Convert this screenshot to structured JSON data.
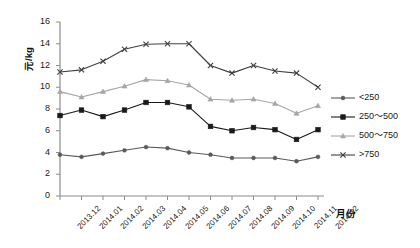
{
  "chart_data": {
    "type": "line",
    "title": "",
    "xlabel": "月份",
    "ylabel": "元/kg",
    "ylim": [
      0,
      16
    ],
    "ytick_step": 2,
    "grid": false,
    "legend_position": "right",
    "categories": [
      "2013.12",
      "2014.01",
      "2014.02",
      "2014.03",
      "2014.04",
      "2014.05",
      "2014.06",
      "2014.07",
      "2014.08",
      "2014.09",
      "2014.10",
      "2014.11",
      "2014.12"
    ],
    "yticks": [
      "0",
      "2",
      "4",
      "6",
      "8",
      "10",
      "12",
      "14",
      "16"
    ],
    "series": [
      {
        "name": "<250",
        "marker": "dot",
        "color": "#595959",
        "values": [
          3.8,
          3.6,
          3.9,
          4.2,
          4.5,
          4.4,
          4.0,
          3.8,
          3.5,
          3.5,
          3.5,
          3.2,
          3.6
        ]
      },
      {
        "name": "250～500",
        "marker": "square",
        "color": "#1a1a1a",
        "values": [
          7.4,
          7.9,
          7.3,
          7.9,
          8.6,
          8.6,
          8.2,
          6.4,
          6.0,
          6.3,
          6.1,
          5.2,
          6.1
        ]
      },
      {
        "name": "500～750",
        "marker": "triangle",
        "color": "#a6a6a6",
        "values": [
          9.6,
          9.1,
          9.6,
          10.1,
          10.7,
          10.6,
          10.2,
          8.9,
          8.8,
          8.9,
          8.5,
          7.6,
          8.3
        ]
      },
      {
        "name": ">750",
        "marker": "cross",
        "color": "#404040",
        "values": [
          11.4,
          11.6,
          12.4,
          13.5,
          13.95,
          14.0,
          14.0,
          12.0,
          11.3,
          12.0,
          11.5,
          11.3,
          10.0
        ]
      }
    ]
  },
  "legend": {
    "items": [
      {
        "label": "<250"
      },
      {
        "label": "250～500"
      },
      {
        "label": "500～750"
      },
      {
        "label": ">750"
      }
    ]
  }
}
